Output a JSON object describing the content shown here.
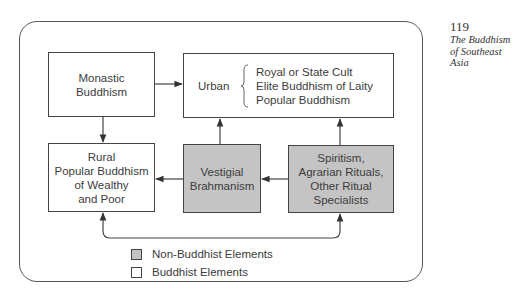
{
  "margin": {
    "page_number": "119",
    "running_title_lines": [
      "The Buddhism",
      "of Southeast",
      "Asia"
    ]
  },
  "diagram": {
    "nodes": {
      "monastic": {
        "lines": [
          "Monastic",
          "Buddhism"
        ],
        "category": "buddhist"
      },
      "urban": {
        "label": "Urban",
        "sub_items": [
          "Royal or State Cult",
          "Elite Buddhism of Laity",
          "Popular Buddhism"
        ],
        "category": "buddhist"
      },
      "rural": {
        "lines": [
          "Rural",
          "Popular Buddhism",
          "of Wealthy",
          "and Poor"
        ],
        "category": "buddhist"
      },
      "vestigial": {
        "lines": [
          "Vestigial",
          "Brahmanism"
        ],
        "category": "non-buddhist"
      },
      "spiritism": {
        "lines": [
          "Spiritism,",
          "Agrarian Rituals,",
          "Other Ritual",
          "Specialists"
        ],
        "category": "non-buddhist"
      }
    },
    "edges": [
      {
        "from": "Monastic Buddhism",
        "to": "Urban"
      },
      {
        "from": "Monastic Buddhism",
        "to": "Rural Popular Buddhism"
      },
      {
        "from": "Vestigial Brahmanism",
        "to": "Urban"
      },
      {
        "from": "Spiritism",
        "to": "Urban"
      },
      {
        "from": "Vestigial Brahmanism",
        "to": "Rural Popular Buddhism"
      },
      {
        "from": "Spiritism",
        "to": "Vestigial Brahmanism"
      },
      {
        "from": "Rural Popular Buddhism",
        "to": "Spiritism",
        "bidirectional": true
      }
    ],
    "legend": [
      {
        "label": "Non-Buddhist Elements",
        "color": "#c4c4c4"
      },
      {
        "label": "Buddhist Elements",
        "color": "#ffffff"
      }
    ]
  },
  "colors": {
    "non_buddhist_fill": "#c4c4c4",
    "buddhist_fill": "#ffffff",
    "line": "#444444"
  }
}
